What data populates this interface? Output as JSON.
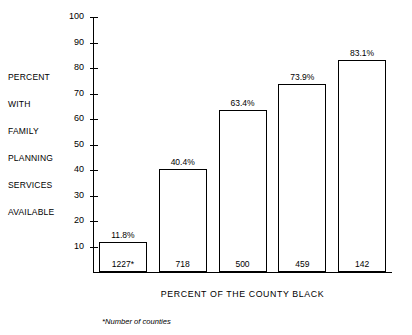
{
  "chart_data": {
    "type": "bar",
    "title": "",
    "categories": [
      "Zero",
      "1-5",
      "6-20",
      "21-50",
      "51-99"
    ],
    "values": [
      11.8,
      40.4,
      63.4,
      73.9,
      83.1
    ],
    "value_labels": [
      "11.8%",
      "40.4%",
      "63.4%",
      "73.9%",
      "83.1%"
    ],
    "bar_counts": [
      "1227*",
      "718",
      "500",
      "459",
      "142"
    ],
    "counts_numeric": [
      1227,
      718,
      500,
      459,
      142
    ],
    "xlabel": "PERCENT OF THE COUNTY BLACK",
    "ylabel": "PERCENT WITH FAMILY PLANNING SERVICES AVAILABLE",
    "ylabel_words": [
      "PERCENT",
      "WITH",
      "FAMILY",
      "PLANNING",
      "SERVICES",
      "AVAILABLE"
    ],
    "ylim": [
      0,
      100
    ],
    "ytick_values": [
      10,
      20,
      30,
      40,
      50,
      60,
      70,
      80,
      90,
      100
    ],
    "ytick_labels": [
      "10",
      "20",
      "30",
      "40",
      "50",
      "60",
      "70",
      "80",
      "90",
      "100"
    ],
    "grid": false,
    "legend": "none",
    "footnote": "*Number of counties",
    "bar_fill_color": "#ffffff",
    "bar_edge_color": "#000000",
    "axis_color": "#000000",
    "background_color": "#ffffff"
  }
}
